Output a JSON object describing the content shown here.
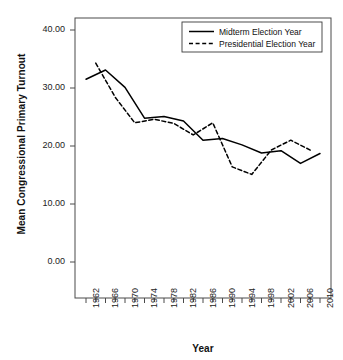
{
  "chart_data": {
    "type": "line",
    "title": "",
    "xlabel": "Year",
    "ylabel": "Mean Congressional Primary Turnout",
    "xlim": [
      1961,
      2011
    ],
    "ylim": [
      0,
      40
    ],
    "ytick_labels": [
      "0.00",
      "10.00",
      "20.00",
      "30.00",
      "40.00"
    ],
    "ytick_values": [
      0,
      10,
      20,
      30,
      40
    ],
    "xtick_labels": [
      "1962",
      "1966",
      "1970",
      "1974",
      "1978",
      "1982",
      "1986",
      "1990",
      "1994",
      "1998",
      "2002",
      "2006",
      "2010"
    ],
    "xtick_values": [
      1962,
      1966,
      1970,
      1974,
      1978,
      1982,
      1986,
      1990,
      1994,
      1998,
      2002,
      2006,
      2010
    ],
    "xminor_values": [
      1964,
      1968,
      1972,
      1976,
      1980,
      1984,
      1988,
      1992,
      1996,
      2000,
      2004,
      2008
    ],
    "grid": false,
    "legend_position": "top-right",
    "series": [
      {
        "name": "Midterm Election Year",
        "style": "solid",
        "color": "#000000",
        "x": [
          1962,
          1966,
          1970,
          1974,
          1978,
          1982,
          1986,
          1990,
          1994,
          1998,
          2002,
          2006,
          2010
        ],
        "values": [
          31.5,
          33.1,
          30.1,
          24.8,
          25.1,
          24.3,
          21.0,
          21.3,
          20.2,
          18.8,
          19.2,
          17.0,
          18.7
        ]
      },
      {
        "name": "Presidential Election Year",
        "style": "dashed",
        "color": "#000000",
        "x": [
          1964,
          1968,
          1972,
          1976,
          1980,
          1984,
          1988,
          1992,
          1996,
          2000,
          2004,
          2008
        ],
        "values": [
          34.3,
          28.4,
          24.0,
          24.6,
          23.9,
          21.9,
          24.0,
          16.4,
          15.1,
          19.3,
          21.0,
          19.3
        ]
      }
    ],
    "legend": [
      {
        "label": "Midterm Election Year",
        "style": "solid"
      },
      {
        "label": "Presidential Election Year",
        "style": "dashed"
      }
    ]
  }
}
